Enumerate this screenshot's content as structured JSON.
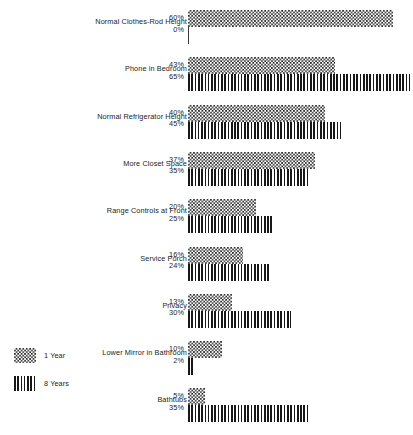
{
  "chart_data": {
    "type": "bar",
    "orientation": "horizontal",
    "title": "",
    "subtitle": "",
    "xlabel": "",
    "ylabel": "",
    "xlim": [
      0,
      65
    ],
    "grid": false,
    "legend_position": "bottom-left",
    "value_suffix": "%",
    "categories": [
      "Normal Clothes-Rod Height",
      "Phone in Bedroom",
      "Normal Refrigerator Height",
      "More Closet Space",
      "Range Controls at Front",
      "Service Porch",
      "Privacy",
      "Lower Mirror in Bathroom",
      "Bathtubs"
    ],
    "series": [
      {
        "name": "1 Year",
        "pattern": "checkerboard",
        "values": [
          60,
          43,
          40,
          37,
          20,
          16,
          13,
          10,
          5
        ],
        "labels": [
          "60%",
          "43%",
          "40%",
          "37%",
          "20%",
          "16%",
          "13%",
          "10%",
          "5%"
        ]
      },
      {
        "name": "8 Years",
        "pattern": "vertical-stripes",
        "values": [
          0,
          65,
          45,
          35,
          25,
          24,
          30,
          2,
          35
        ],
        "labels": [
          "0%",
          "65%",
          "45%",
          "35%",
          "25%",
          "24%",
          "30%",
          "2%",
          "35%"
        ]
      }
    ]
  },
  "legend": {
    "items": [
      {
        "label": "1 Year",
        "pattern": "checkerboard"
      },
      {
        "label": "8 Years",
        "pattern": "vertical-stripes"
      }
    ]
  }
}
